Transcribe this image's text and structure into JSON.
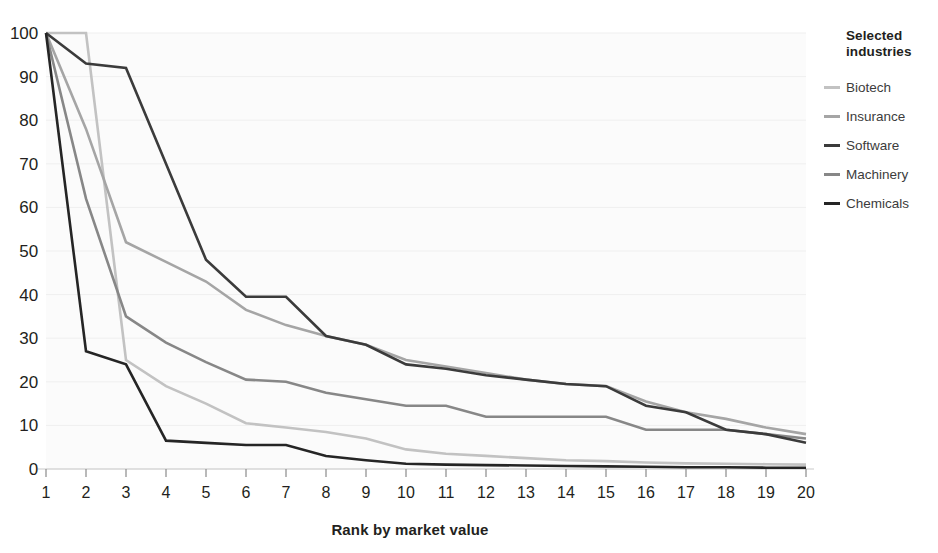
{
  "legend": {
    "title_line1": "Selected",
    "title_line2": "industries",
    "items": [
      {
        "label": "Biotech",
        "color": "#c2c2c2"
      },
      {
        "label": "Insurance",
        "color": "#a5a5a5"
      },
      {
        "label": "Software",
        "color": "#3b3b3b"
      },
      {
        "label": "Machinery",
        "color": "#878787"
      },
      {
        "label": "Chemicals",
        "color": "#252525"
      }
    ]
  },
  "axes": {
    "x_title": "Rank by market value",
    "y_ticks": [
      "100",
      "90",
      "80",
      "70",
      "60",
      "50",
      "40",
      "30",
      "20",
      "10",
      "0"
    ],
    "x_ticks": [
      "1",
      "2",
      "3",
      "4",
      "5",
      "6",
      "7",
      "8",
      "9",
      "10",
      "11",
      "12",
      "13",
      "14",
      "15",
      "16",
      "17",
      "18",
      "19",
      "20"
    ]
  },
  "chart_data": {
    "type": "line",
    "title": "",
    "subtitle": "",
    "xlabel": "Rank by market value",
    "ylabel": "",
    "xlim": [
      1,
      20
    ],
    "ylim": [
      0,
      100
    ],
    "grid": true,
    "legend_position": "right",
    "legend_title": "Selected industries",
    "x": [
      1,
      2,
      3,
      4,
      5,
      6,
      7,
      8,
      9,
      10,
      11,
      12,
      13,
      14,
      15,
      16,
      17,
      18,
      19,
      20
    ],
    "categories": [
      "1",
      "2",
      "3",
      "4",
      "5",
      "6",
      "7",
      "8",
      "9",
      "10",
      "11",
      "12",
      "13",
      "14",
      "15",
      "16",
      "17",
      "18",
      "19",
      "20"
    ],
    "series": [
      {
        "name": "Biotech",
        "color": "#c2c2c2",
        "values": [
          100,
          100,
          25,
          19,
          15,
          10.5,
          9.5,
          8.5,
          7,
          4.5,
          3.5,
          3,
          2.5,
          2,
          1.8,
          1.5,
          1.3,
          1.2,
          1.1,
          1
        ]
      },
      {
        "name": "Insurance",
        "color": "#a5a5a5",
        "values": [
          100,
          78,
          52,
          47.5,
          43,
          36.5,
          33,
          30.5,
          28.5,
          25,
          23.5,
          22,
          20.5,
          19.5,
          19,
          15.5,
          13,
          11.5,
          9.5,
          8
        ]
      },
      {
        "name": "Software",
        "color": "#3b3b3b",
        "values": [
          100,
          93,
          92,
          70,
          48,
          39.5,
          39.5,
          30.5,
          28.5,
          24,
          23,
          21.5,
          20.5,
          19.5,
          19,
          14.5,
          13,
          9,
          8,
          6
        ]
      },
      {
        "name": "Machinery",
        "color": "#878787",
        "values": [
          100,
          62,
          35,
          29,
          24.5,
          20.5,
          20,
          17.5,
          16,
          14.5,
          14.5,
          12,
          12,
          12,
          12,
          9,
          9,
          9,
          8,
          7
        ]
      },
      {
        "name": "Chemicals",
        "color": "#252525",
        "values": [
          100,
          27,
          24,
          6.5,
          6,
          5.5,
          5.5,
          3,
          2,
          1.2,
          1,
          0.9,
          0.8,
          0.7,
          0.6,
          0.5,
          0.4,
          0.4,
          0.3,
          0.3
        ]
      }
    ]
  }
}
